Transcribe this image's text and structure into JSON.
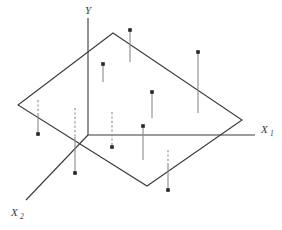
{
  "figure": {
    "name": "three-dimensional-regression-plane-scatter",
    "width": 282,
    "height": 230,
    "background": "#ffffff",
    "stroke_color": "#3a3a3a",
    "plane_stroke_color": "#3a3a3a",
    "dashed_stroke_color": "#8a8a8a",
    "point_color": "#262626"
  },
  "axes": {
    "origin": {
      "x": 88,
      "y": 135
    },
    "x1": {
      "label": "X",
      "subscript": "1",
      "label_x": 261,
      "label_y": 133,
      "sub_x": 270,
      "sub_y": 136,
      "line": {
        "x1": 88,
        "y1": 135,
        "x2": 255,
        "y2": 135
      }
    },
    "x2": {
      "label": "X",
      "subscript": "2",
      "label_x": 11,
      "label_y": 216,
      "sub_x": 20,
      "sub_y": 219,
      "line": {
        "x1": 88,
        "y1": 135,
        "x2": 26,
        "y2": 200
      }
    },
    "y": {
      "label": "Y",
      "label_x": 85,
      "label_y": 14,
      "line": {
        "x1": 88,
        "y1": 18,
        "x2": 88,
        "y2": 135
      }
    }
  },
  "plane": {
    "name": "regression-plane",
    "vertices": [
      {
        "x": 113,
        "y": 33
      },
      {
        "x": 242,
        "y": 120
      },
      {
        "x": 147,
        "y": 186
      },
      {
        "x": 18,
        "y": 105
      }
    ]
  },
  "observations": [
    {
      "id": "obs-1",
      "x": 130,
      "dot_y": 30,
      "top_y": 30,
      "plane_y": 62,
      "dashed": false,
      "dash_from": null,
      "dash_to": null
    },
    {
      "id": "obs-2",
      "x": 198,
      "dot_y": 52,
      "top_y": 52,
      "plane_y": 113,
      "dashed": false,
      "dash_from": null,
      "dash_to": null
    },
    {
      "id": "obs-3",
      "x": 103,
      "dot_y": 64,
      "top_y": 64,
      "plane_y": 82,
      "dashed": false,
      "dash_from": null,
      "dash_to": null
    },
    {
      "id": "obs-4",
      "x": 152,
      "dot_y": 92,
      "top_y": 92,
      "plane_y": 118,
      "dashed": false,
      "dash_from": null,
      "dash_to": null
    },
    {
      "id": "obs-5",
      "x": 143,
      "dot_y": 126,
      "top_y": 126,
      "plane_y": 160,
      "dashed": false,
      "dash_from": null,
      "dash_to": null
    },
    {
      "id": "obs-6",
      "x": 38,
      "dot_y": 134,
      "top_y": 113,
      "plane_y": 134,
      "dashed": true,
      "dash_from": 100,
      "dash_to": 113
    },
    {
      "id": "obs-7",
      "x": 75,
      "dot_y": 173,
      "top_y": 137,
      "plane_y": 173,
      "dashed": true,
      "dash_from": 108,
      "dash_to": 137
    },
    {
      "id": "obs-8",
      "x": 112,
      "dot_y": 147,
      "top_y": 147,
      "plane_y": 147,
      "dashed": true,
      "dash_from": 112,
      "dash_to": 147
    },
    {
      "id": "obs-9",
      "x": 168,
      "dot_y": 190,
      "top_y": 163,
      "plane_y": 190,
      "dashed": true,
      "dash_from": 150,
      "dash_to": 163
    }
  ]
}
